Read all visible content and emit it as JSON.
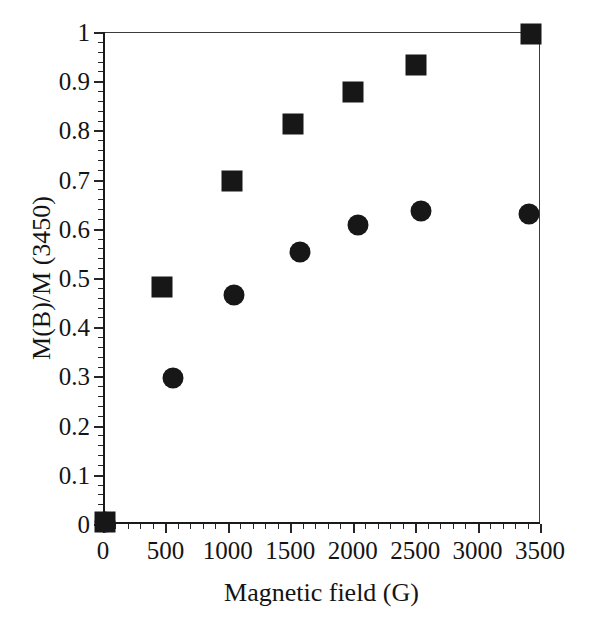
{
  "chart_data": {
    "type": "scatter",
    "title": "",
    "xlabel": "Magnetic field (G)",
    "ylabel": "M(B)/M (3450)",
    "xlim": [
      0,
      3500
    ],
    "ylim": [
      0,
      1
    ],
    "grid": false,
    "legend": "none",
    "x_ticks": [
      0,
      500,
      1000,
      1500,
      2000,
      2500,
      3000,
      3500
    ],
    "x_tick_labels": [
      "0",
      "500",
      "1000",
      "1500",
      "2000",
      "2500",
      "3000",
      "3500"
    ],
    "x_minor_per_major": 5,
    "y_ticks": [
      0,
      0.1,
      0.2,
      0.3,
      0.4,
      0.5,
      0.6,
      0.7,
      0.8,
      0.9,
      1
    ],
    "y_tick_labels": [
      "0",
      "0.1",
      "0.2",
      "0.3",
      "0.4",
      "0.5",
      "0.6",
      "0.7",
      "0.8",
      "0.9",
      "1"
    ],
    "y_minor_per_major": 5,
    "series": [
      {
        "name": "squares",
        "marker": "square",
        "color": "#171717",
        "points": [
          {
            "x": 20,
            "y": 0.005
          },
          {
            "x": 470,
            "y": 0.482
          },
          {
            "x": 1030,
            "y": 0.698
          },
          {
            "x": 1520,
            "y": 0.813
          },
          {
            "x": 2000,
            "y": 0.878
          },
          {
            "x": 2510,
            "y": 0.933
          },
          {
            "x": 3430,
            "y": 0.995
          }
        ]
      },
      {
        "name": "circles",
        "marker": "circle",
        "color": "#171717",
        "points": [
          {
            "x": 20,
            "y": 0.005
          },
          {
            "x": 560,
            "y": 0.297
          },
          {
            "x": 1050,
            "y": 0.465
          },
          {
            "x": 1580,
            "y": 0.552
          },
          {
            "x": 2040,
            "y": 0.608
          },
          {
            "x": 2550,
            "y": 0.637
          },
          {
            "x": 3410,
            "y": 0.63
          }
        ]
      }
    ]
  },
  "scan_artifact": {
    "text": ""
  }
}
